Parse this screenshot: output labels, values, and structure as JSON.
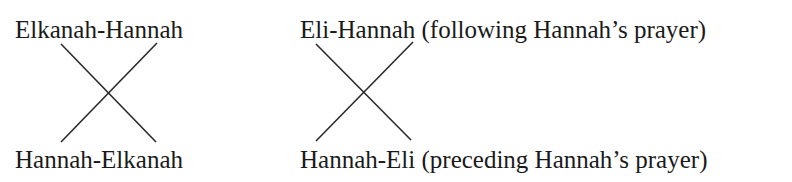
{
  "left_diagram": {
    "top_label": "Elkanah-Hannah",
    "bottom_label": "Hannah-Elkanah"
  },
  "right_diagram": {
    "top_label": "Eli-Hannah (following Hannah’s prayer)",
    "bottom_label": "Hannah-Eli (preceding Hannah’s prayer)"
  },
  "colors": {
    "text": "#1a1a1a",
    "lines": "#2a2a2a",
    "background": "#ffffff"
  }
}
